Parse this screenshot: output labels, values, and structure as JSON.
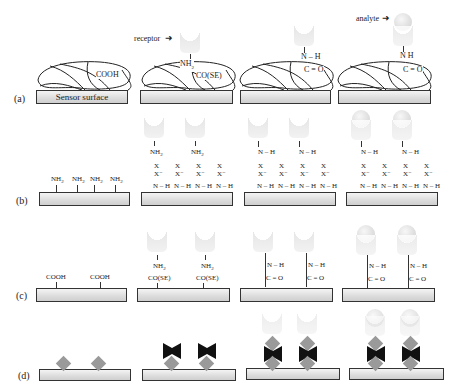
{
  "rows": [
    {
      "id": "a",
      "label": "(a)"
    },
    {
      "id": "b",
      "label": "(b)"
    },
    {
      "id": "c",
      "label": "(c)"
    },
    {
      "id": "d",
      "label": "(d)"
    }
  ],
  "annotations": {
    "receptor": "receptor",
    "analyte": "analyte",
    "sensor_surface": "Sensor surface"
  },
  "chem": {
    "cooh": "COOH",
    "nh2": "NH",
    "nh2_sub": "2",
    "co_se": "CO(SE)",
    "nh": "N – H",
    "n_h_split": "N   H",
    "c_eq_o": "C = O",
    "x": "X",
    "x_minus": "X⁻",
    "nh_link": "N – H"
  }
}
